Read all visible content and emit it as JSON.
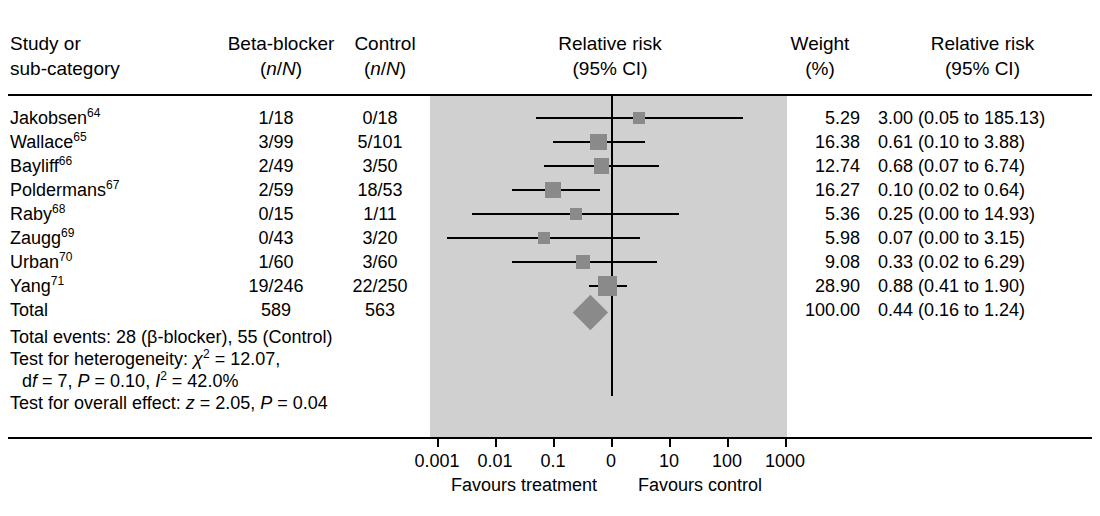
{
  "header": {
    "study_line1": "Study or",
    "study_line2": "sub-category",
    "beta_line1": "Beta-blocker",
    "beta_line2_pre": "(",
    "beta_line2_n": "n",
    "beta_line2_mid": "/",
    "beta_line2_N": "N",
    "beta_line2_post": ")",
    "control_line1": "Control",
    "rr_line1": "Relative risk",
    "rr_line2": "(95% CI)",
    "weight_line1": "Weight",
    "weight_line2": "(%)",
    "rr2_line1": "Relative risk",
    "rr2_line2": "(95% CI)"
  },
  "rows": [
    {
      "study": "Jakobsen",
      "ref": "64",
      "beta": "1/18",
      "control": "0/18",
      "weight": "5.29",
      "rr_text": "3.00 (0.05 to 185.13)",
      "rr": 3.0,
      "lo": 0.05,
      "hi": 185.13
    },
    {
      "study": "Wallace",
      "ref": "65",
      "beta": "3/99",
      "control": "5/101",
      "weight": "16.38",
      "rr_text": "0.61 (0.10 to 3.88)",
      "rr": 0.61,
      "lo": 0.1,
      "hi": 3.88
    },
    {
      "study": "Bayliff",
      "ref": "66",
      "beta": "2/49",
      "control": "3/50",
      "weight": "12.74",
      "rr_text": "0.68 (0.07 to 6.74)",
      "rr": 0.68,
      "lo": 0.07,
      "hi": 6.74
    },
    {
      "study": "Poldermans",
      "ref": "67",
      "beta": "2/59",
      "control": "18/53",
      "weight": "16.27",
      "rr_text": "0.10 (0.02 to 0.64)",
      "rr": 0.1,
      "lo": 0.02,
      "hi": 0.64
    },
    {
      "study": "Raby",
      "ref": "68",
      "beta": "0/15",
      "control": "1/11",
      "weight": "5.36",
      "rr_text": "0.25 (0.00 to 14.93)",
      "rr": 0.25,
      "lo": 0.004,
      "hi": 14.93
    },
    {
      "study": "Zaugg",
      "ref": "69",
      "beta": "0/43",
      "control": "3/20",
      "weight": "5.98",
      "rr_text": "0.07 (0.00 to 3.15)",
      "rr": 0.07,
      "lo": 0.0015,
      "hi": 3.15
    },
    {
      "study": "Urban",
      "ref": "70",
      "beta": "1/60",
      "control": "3/60",
      "weight": "9.08",
      "rr_text": "0.33 (0.02 to 6.29)",
      "rr": 0.33,
      "lo": 0.02,
      "hi": 6.29
    },
    {
      "study": "Yang",
      "ref": "71",
      "beta": "19/246",
      "control": "22/250",
      "weight": "28.90",
      "rr_text": "0.88 (0.41 to 1.90)",
      "rr": 0.88,
      "lo": 0.41,
      "hi": 1.9
    }
  ],
  "total": {
    "label": "Total",
    "beta": "589",
    "control": "563",
    "weight": "100.00",
    "rr_text": "0.44 (0.16 to 1.24)",
    "rr": 0.44,
    "lo": 0.16,
    "hi": 1.24
  },
  "stats": {
    "total_events_pre": "Total events: 28 (",
    "total_events_beta": "β",
    "total_events_post": "-blocker), 55 (Control)",
    "het_pre": "Test for heterogeneity: ",
    "het_chi": "χ",
    "het_chi_sup": "2",
    "het_chi_val": " = 12.07,",
    "het_df_pre": "d",
    "het_df_f": "f",
    "het_df_val": " = 7, ",
    "het_p": "P",
    "het_p_val": " = 0.10, ",
    "het_i": "I",
    "het_i_sup": "2",
    "het_i_val": " = 42.0%",
    "overall_pre": "Test for overall effect: ",
    "overall_z": "z",
    "overall_z_val": " = 2.05, ",
    "overall_p": "P",
    "overall_p_val": " = 0.04"
  },
  "axis": {
    "ticks": [
      "0.001",
      "0.01",
      "0.1",
      "0",
      "10",
      "100",
      "1000"
    ],
    "tick_x": [
      437,
      495,
      553,
      611,
      669,
      727,
      785
    ],
    "favours_left": "Favours treatment",
    "favours_right": "Favours control"
  },
  "colors": {
    "band": "#d0d0d0",
    "marker": "#8a8a8a",
    "line": "#000000"
  },
  "chart_data": {
    "type": "forest",
    "title": "Relative risk (95% CI)",
    "xlabel": "Relative risk",
    "xscale": "log",
    "xticks": [
      0.001,
      0.01,
      0.1,
      1,
      10,
      100,
      1000
    ],
    "null_value": 1,
    "categories": [
      "Jakobsen",
      "Wallace",
      "Bayliff",
      "Poldermans",
      "Raby",
      "Zaugg",
      "Urban",
      "Yang",
      "Total"
    ],
    "values": [
      3.0,
      0.61,
      0.68,
      0.1,
      0.25,
      0.07,
      0.33,
      0.88,
      0.44
    ],
    "ci_low": [
      0.05,
      0.1,
      0.07,
      0.02,
      0.0,
      0.0,
      0.02,
      0.41,
      0.16
    ],
    "ci_high": [
      185.13,
      3.88,
      6.74,
      0.64,
      14.93,
      3.15,
      6.29,
      1.9,
      1.24
    ],
    "weights": [
      5.29,
      16.38,
      12.74,
      16.27,
      5.36,
      5.98,
      9.08,
      28.9,
      100.0
    ],
    "events_treatment": [
      "1/18",
      "3/99",
      "2/49",
      "2/59",
      "0/15",
      "0/43",
      "1/60",
      "19/246",
      "589"
    ],
    "events_control": [
      "0/18",
      "5/101",
      "3/50",
      "18/53",
      "1/11",
      "3/20",
      "3/60",
      "22/250",
      "563"
    ],
    "heterogeneity": {
      "chi2": 12.07,
      "df": 7,
      "P": 0.1,
      "I2": "42.0%"
    },
    "overall_effect": {
      "z": 2.05,
      "P": 0.04
    }
  }
}
